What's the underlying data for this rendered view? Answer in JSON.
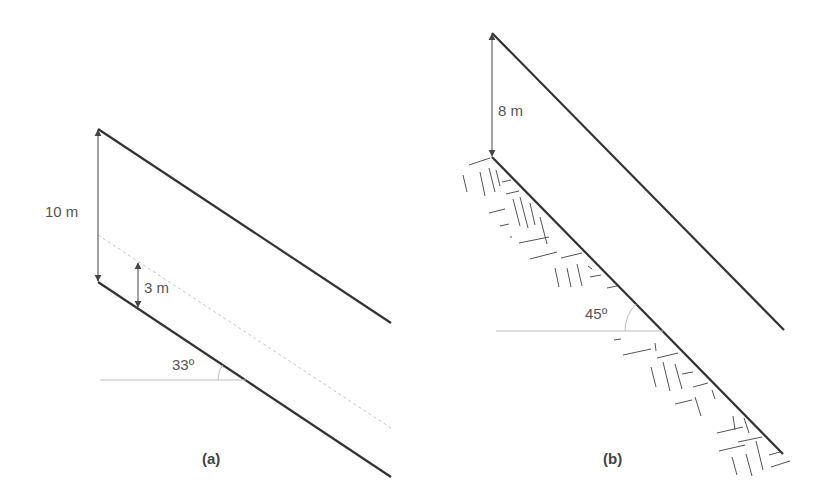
{
  "figure": {
    "colors": {
      "slope_line": "#333333",
      "dim_line": "#444444",
      "reference_line": "#bdbdbd",
      "dashed_line": "#c4c4c4",
      "hatch": "#555555",
      "text": "#555555"
    },
    "panel_a": {
      "caption": "(a)",
      "slope_angle_label": "33º",
      "total_height_label": "10 m",
      "water_table_height_label": "3 m",
      "upper_surface": {
        "x1": 98,
        "y1": 129,
        "x2": 391,
        "y2": 323
      },
      "lower_surface": {
        "x1": 98,
        "y1": 282,
        "x2": 391,
        "y2": 477
      },
      "water_table": {
        "x1": 98,
        "y1": 235,
        "x2": 391,
        "y2": 428
      },
      "total_height_arrow": {
        "x": 98,
        "y1": 130,
        "y2": 281
      },
      "water_height_arrow": {
        "x": 138,
        "y1": 263,
        "y2": 307
      },
      "horizontal_reference": {
        "x1": 100,
        "y1": 380,
        "x2": 246,
        "y2": 380
      },
      "angle_arc": {
        "cx": 246,
        "cy": 380,
        "r": 28,
        "angle_deg": 33
      }
    },
    "panel_b": {
      "caption": "(b)",
      "slope_angle_label": "45º",
      "thickness_label": "8 m",
      "upper_surface": {
        "x1": 492,
        "y1": 33,
        "x2": 784,
        "y2": 330
      },
      "lower_surface": {
        "x1": 492,
        "y1": 157,
        "x2": 783,
        "y2": 454
      },
      "thickness_arrow": {
        "x": 492,
        "y1": 34,
        "y2": 156
      },
      "horizontal_reference": {
        "x1": 496,
        "y1": 331,
        "x2": 663,
        "y2": 331
      },
      "angle_arc": {
        "cx": 663,
        "cy": 331,
        "r": 38,
        "angle_deg": 45
      },
      "bedrock_hatch_label": "rock hatching"
    }
  }
}
